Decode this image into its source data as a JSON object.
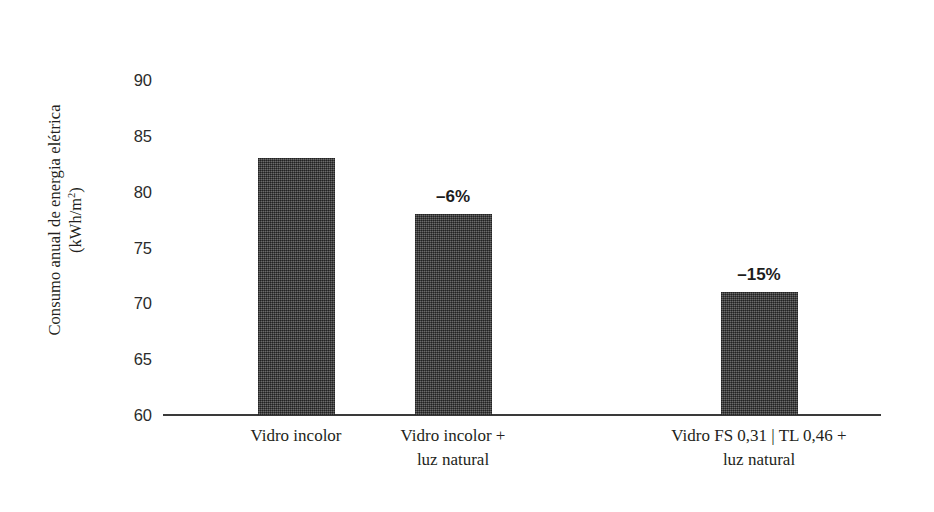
{
  "chart_data": {
    "type": "bar",
    "title": "",
    "subtitle": "",
    "xlabel": "",
    "ylabel": "Consumo anual de energia elétrica (kWh/m²)",
    "ylabel_lines": [
      "Consumo anual de energia elétrica",
      "(kWh/m2)"
    ],
    "ylim": [
      60,
      90
    ],
    "yticks": [
      60,
      65,
      70,
      75,
      80,
      85,
      90
    ],
    "ytick_labels": [
      "60",
      "65",
      "70",
      "75",
      "80",
      "85",
      "90"
    ],
    "grid": false,
    "legend": false,
    "legend_position": "none",
    "categories": [
      "Vidro incolor",
      "Vidro incolor + luz natural",
      "Vidro FS 0,31 | TL 0,46 + luz natural"
    ],
    "category_lines": [
      [
        "Vidro incolor",
        ""
      ],
      [
        "Vidro incolor +",
        "luz natural"
      ],
      [
        "Vidro FS 0,31 |  TL 0,46 +",
        "luz natural"
      ]
    ],
    "values": [
      83,
      78,
      71
    ],
    "annotations": [
      "",
      "–6%",
      "–15%"
    ],
    "bar_color": "#434343",
    "axis_color": "#3a3a3a",
    "text_color": "#231f20"
  },
  "axis": {
    "units_prefix": "(kWh/m",
    "units_exponent": "2",
    "units_suffix": ")"
  }
}
